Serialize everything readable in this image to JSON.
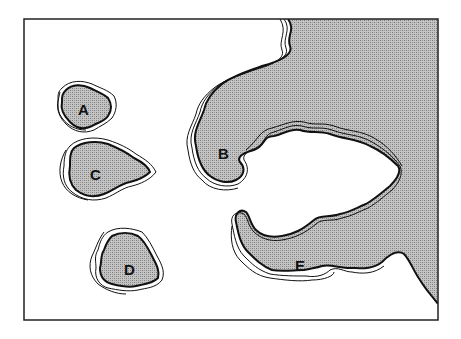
{
  "figure": {
    "type": "map-diagram",
    "frame": {
      "x": 24,
      "y": 19,
      "width": 414,
      "height": 301
    },
    "colors": {
      "land_fill": "#b8b8b8",
      "stipple_dark": "#8a8a8a",
      "outline": "#111111",
      "water": "#ffffff"
    },
    "landmasses": [
      {
        "id": "A",
        "label": "A",
        "label_x": 84,
        "label_y": 109
      },
      {
        "id": "B",
        "label": "B",
        "label_x": 224,
        "label_y": 154
      },
      {
        "id": "C",
        "label": "C",
        "label_x": 96,
        "label_y": 174
      },
      {
        "id": "D",
        "label": "D",
        "label_x": 130,
        "label_y": 270
      },
      {
        "id": "E",
        "label": "E",
        "label_x": 300,
        "label_y": 266
      }
    ]
  }
}
